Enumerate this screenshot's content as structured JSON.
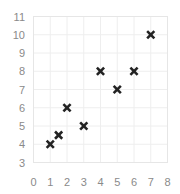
{
  "chart_data": {
    "type": "scatter",
    "title": "",
    "xlabel": "",
    "ylabel": "",
    "xlim": [
      0,
      8
    ],
    "ylim": [
      3,
      11
    ],
    "x_ticks": [
      "0",
      "1",
      "2",
      "3",
      "4",
      "5",
      "6",
      "7",
      "8"
    ],
    "y_ticks": [
      "3",
      "4",
      "5",
      "6",
      "7",
      "8",
      "9",
      "10",
      "11"
    ],
    "grid": true,
    "legend": null,
    "marker": "x",
    "marker_color": "#222222",
    "series": [
      {
        "name": "points",
        "x": [
          1,
          1.5,
          2,
          3,
          4,
          5,
          6,
          7
        ],
        "y": [
          4,
          4.5,
          6,
          5,
          8,
          7,
          8,
          10
        ]
      }
    ]
  }
}
